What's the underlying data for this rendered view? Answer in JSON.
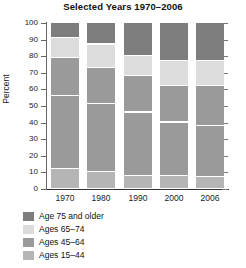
{
  "chart_data": {
    "type": "bar",
    "title": "Selected Years 1970–2006",
    "xlabel": "",
    "ylabel": "Percent",
    "ylim": [
      0,
      100
    ],
    "yticks": [
      0,
      10,
      20,
      30,
      40,
      50,
      60,
      70,
      80,
      90,
      100
    ],
    "grid": false,
    "stacked": true,
    "stack_total": 100,
    "legend_position": "bottom-left",
    "categories": [
      "1970",
      "1980",
      "1990",
      "2000",
      "2006"
    ],
    "series": [
      {
        "name": "Ages 15–44",
        "color": "#b5b5b5",
        "values": [
          12,
          10,
          7,
          7,
          6
        ]
      },
      {
        "name": "Ages 45–64",
        "color": "#9a9a9a",
        "values": [
          44,
          41,
          38,
          32,
          31
        ]
      },
      {
        "name": "Ages 45–64 upper",
        "color": "#9a9a9a",
        "values": [
          23,
          22,
          19,
          22,
          23
        ]
      },
      {
        "name": "Ages 65–74",
        "color": "#dcdcdc",
        "values": [
          12,
          14,
          8,
          14,
          13
        ]
      },
      {
        "name": "Age 75 and older",
        "color": "#7d7d7d",
        "values": [
          9,
          13,
          28,
          25,
          27
        ]
      }
    ],
    "stacks": [
      {
        "category": "1970",
        "segments": [
          {
            "name": "Ages 15–44",
            "from": 0,
            "to": 12,
            "color": "#b5b5b5"
          },
          {
            "name": "Ages 45–64",
            "from": 12,
            "to": 56,
            "color": "#9a9a9a"
          },
          {
            "name": "Ages 45–64",
            "from": 56,
            "to": 79,
            "color": "#9a9a9a"
          },
          {
            "name": "Ages 65–74",
            "from": 79,
            "to": 91,
            "color": "#dcdcdc"
          },
          {
            "name": "Age 75 and older",
            "from": 91,
            "to": 100,
            "color": "#7d7d7d"
          }
        ]
      },
      {
        "category": "1980",
        "segments": [
          {
            "name": "Ages 15–44",
            "from": 0,
            "to": 10,
            "color": "#b5b5b5"
          },
          {
            "name": "Ages 45–64",
            "from": 10,
            "to": 51,
            "color": "#9a9a9a"
          },
          {
            "name": "Ages 45–64",
            "from": 51,
            "to": 73,
            "color": "#9a9a9a"
          },
          {
            "name": "Ages 65–74",
            "from": 73,
            "to": 87,
            "color": "#dcdcdc"
          },
          {
            "name": "Age 75 and older",
            "from": 87,
            "to": 100,
            "color": "#7d7d7d"
          }
        ]
      },
      {
        "category": "1990",
        "segments": [
          {
            "name": "Ages 15–44",
            "from": 0,
            "to": 8,
            "color": "#b5b5b5"
          },
          {
            "name": "Ages 45–64",
            "from": 8,
            "to": 46,
            "color": "#9a9a9a"
          },
          {
            "name": "Ages 45–64",
            "from": 46,
            "to": 68,
            "color": "#9a9a9a"
          },
          {
            "name": "Ages 65–74",
            "from": 68,
            "to": 80,
            "color": "#dcdcdc"
          },
          {
            "name": "Age 75 and older",
            "from": 80,
            "to": 100,
            "color": "#7d7d7d"
          }
        ]
      },
      {
        "category": "2000",
        "segments": [
          {
            "name": "Ages 15–44",
            "from": 0,
            "to": 8,
            "color": "#b5b5b5"
          },
          {
            "name": "Ages 45–64",
            "from": 8,
            "to": 40,
            "color": "#9a9a9a"
          },
          {
            "name": "Ages 45–64",
            "from": 40,
            "to": 62,
            "color": "#9a9a9a"
          },
          {
            "name": "Ages 65–74",
            "from": 62,
            "to": 77,
            "color": "#dcdcdc"
          },
          {
            "name": "Age 75 and older",
            "from": 77,
            "to": 100,
            "color": "#7d7d7d"
          }
        ]
      },
      {
        "category": "2006",
        "segments": [
          {
            "name": "Ages 15–44",
            "from": 0,
            "to": 7,
            "color": "#b5b5b5"
          },
          {
            "name": "Ages 45–64",
            "from": 7,
            "to": 38,
            "color": "#9a9a9a"
          },
          {
            "name": "Ages 45–64",
            "from": 38,
            "to": 62,
            "color": "#9a9a9a"
          },
          {
            "name": "Ages 65–74",
            "from": 62,
            "to": 77,
            "color": "#dcdcdc"
          },
          {
            "name": "Age 75 and older",
            "from": 77,
            "to": 100,
            "color": "#7d7d7d"
          }
        ]
      }
    ]
  },
  "axis": {
    "y_title": "Percent",
    "y_tick_labels": [
      "100",
      "90",
      "80",
      "70",
      "60",
      "50",
      "40",
      "30",
      "20",
      "10",
      "0"
    ],
    "x_tick_labels": [
      "1970",
      "1980",
      "1990",
      "2000",
      "2006"
    ]
  },
  "legend": {
    "items": [
      {
        "label": "Age 75 and older",
        "color": "#7d7d7d"
      },
      {
        "label": "Ages 65–74",
        "color": "#dcdcdc"
      },
      {
        "label": "Ages 45–64",
        "color": "#9a9a9a"
      },
      {
        "label": "Ages 15–44",
        "color": "#b5b5b5"
      }
    ]
  }
}
